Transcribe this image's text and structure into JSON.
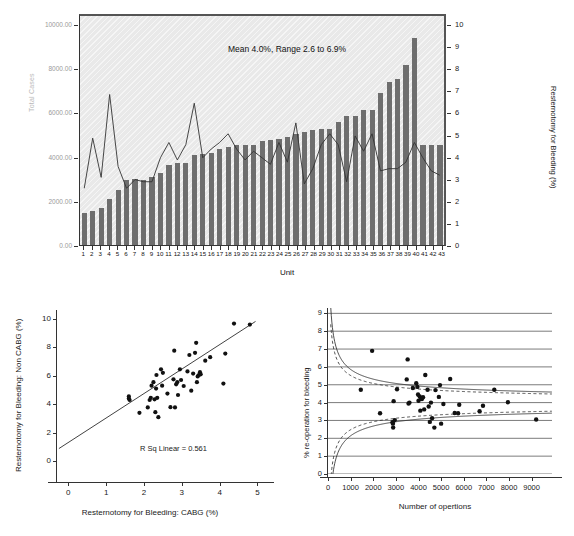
{
  "chart_data": [
    {
      "type": "bar",
      "id": "unit-resternotomy-combo",
      "title": "",
      "annotation": "Mean 4.0%, Range 2.6 to 6.9%",
      "xlabel": "Unit",
      "ylabel": "Total Cases",
      "y2label": "Resternotomy for Bleeding (%)",
      "categories": [
        "1",
        "2",
        "3",
        "4",
        "5",
        "6",
        "7",
        "8",
        "9",
        "10",
        "11",
        "12",
        "13",
        "14",
        "15",
        "16",
        "17",
        "18",
        "19",
        "20",
        "21",
        "22",
        "23",
        "24",
        "25",
        "26",
        "27",
        "28",
        "29",
        "30",
        "31",
        "32",
        "33",
        "34",
        "35",
        "36",
        "37",
        "38",
        "39",
        "40",
        "41",
        "42",
        "43"
      ],
      "ytick_labels": [
        "0.00",
        "2000.00",
        "4000.00",
        "6000.00",
        "8000.00",
        "10000.00"
      ],
      "ytick_values": [
        0,
        2000,
        4000,
        6000,
        8000,
        10000
      ],
      "ylim": [
        0,
        10500
      ],
      "y2tick_labels": [
        "0",
        "1",
        "2",
        "3",
        "4",
        "5",
        "6",
        "7",
        "8",
        "9",
        "10"
      ],
      "y2lim": [
        0,
        10.5
      ],
      "grid": false,
      "bar_color": "#6e6e6e",
      "plot_bg": "#e9e9e9",
      "series": [
        {
          "name": "Total Cases",
          "kind": "bar",
          "values": [
            1450,
            1530,
            1690,
            2090,
            2470,
            2920,
            3000,
            2950,
            3080,
            3240,
            3620,
            3720,
            3700,
            4090,
            4120,
            4180,
            4350,
            4420,
            4530,
            4530,
            4530,
            4730,
            4740,
            4800,
            4880,
            5030,
            5120,
            5190,
            5230,
            5230,
            5590,
            5830,
            5840,
            6090,
            6100,
            6880,
            7400,
            7530,
            8150,
            9350,
            4530,
            4530,
            4530
          ]
        },
        {
          "name": "Resternotomy for Bleeding (%)",
          "kind": "line",
          "values": [
            2.6,
            4.9,
            3.1,
            6.9,
            3.6,
            2.6,
            3.0,
            2.9,
            2.9,
            4.0,
            4.7,
            3.9,
            4.6,
            6.5,
            4.0,
            4.4,
            4.7,
            5.1,
            4.4,
            3.9,
            4.3,
            4.0,
            3.7,
            4.7,
            3.8,
            5.6,
            2.8,
            3.5,
            4.6,
            5.1,
            4.6,
            2.9,
            5.0,
            4.3,
            5.1,
            3.4,
            3.5,
            3.5,
            3.8,
            4.7,
            4.0,
            3.4,
            3.2
          ]
        }
      ]
    },
    {
      "type": "scatter",
      "id": "cabg-vs-noncabg",
      "title": "",
      "xlabel": "Resternotomy for Bleeding: CABG (%)",
      "ylabel": "Resternotomy for Bleeding: Non CABG (%)",
      "annotation": "R Sq Linear = 0.561",
      "xlim": [
        -0.3,
        5.2
      ],
      "ylim": [
        -0.6,
        10.6
      ],
      "xtick_labels": [
        "0",
        "1",
        "2",
        "3",
        "4",
        "5"
      ],
      "ytick_labels": [
        "0",
        "2",
        "4",
        "6",
        "8",
        "10"
      ],
      "fit_line": {
        "x0": -0.25,
        "y0": 0.9,
        "x1": 4.95,
        "y1": 9.8
      },
      "points": [
        [
          1.6,
          4.55
        ],
        [
          1.6,
          4.4
        ],
        [
          1.62,
          4.3
        ],
        [
          1.88,
          3.4
        ],
        [
          2.1,
          3.78
        ],
        [
          2.15,
          4.3
        ],
        [
          2.18,
          4.45
        ],
        [
          2.2,
          5.3
        ],
        [
          2.25,
          5.55
        ],
        [
          2.28,
          4.35
        ],
        [
          2.3,
          3.45
        ],
        [
          2.32,
          5.1
        ],
        [
          2.33,
          6.05
        ],
        [
          2.35,
          4.45
        ],
        [
          2.38,
          3.1
        ],
        [
          2.45,
          6.45
        ],
        [
          2.48,
          5.3
        ],
        [
          2.5,
          6.2
        ],
        [
          2.62,
          4.75
        ],
        [
          2.7,
          3.8
        ],
        [
          2.78,
          5.75
        ],
        [
          2.8,
          7.75
        ],
        [
          2.82,
          3.78
        ],
        [
          2.85,
          5.4
        ],
        [
          2.88,
          5.55
        ],
        [
          2.9,
          4.65
        ],
        [
          2.95,
          6.45
        ],
        [
          2.98,
          5.7
        ],
        [
          3.05,
          5.28
        ],
        [
          3.15,
          6.3
        ],
        [
          3.2,
          7.45
        ],
        [
          3.25,
          4.95
        ],
        [
          3.3,
          6.15
        ],
        [
          3.35,
          7.6
        ],
        [
          3.38,
          8.3
        ],
        [
          3.4,
          5.55
        ],
        [
          3.42,
          5.95
        ],
        [
          3.45,
          6.05
        ],
        [
          3.48,
          6.25
        ],
        [
          3.5,
          6.1
        ],
        [
          3.62,
          7.05
        ],
        [
          3.75,
          7.3
        ],
        [
          4.1,
          5.45
        ],
        [
          4.15,
          7.55
        ],
        [
          4.38,
          9.65
        ],
        [
          4.8,
          9.58
        ]
      ]
    },
    {
      "type": "scatter",
      "id": "funnel-plot",
      "title": "",
      "xlabel": "Number of opertions",
      "ylabel": "% re-operation for bleeding",
      "xlim": [
        0,
        9900
      ],
      "ylim": [
        0,
        9.3
      ],
      "xtick_labels": [
        "0",
        "1000",
        "2000",
        "3000",
        "4000",
        "5000",
        "6000",
        "7000",
        "8000",
        "9000"
      ],
      "xtick_values": [
        0,
        1000,
        2000,
        3000,
        4000,
        5000,
        6000,
        7000,
        8000,
        9000
      ],
      "ytick_labels": [
        "0",
        "1",
        "2",
        "3",
        "4",
        "5",
        "6",
        "7",
        "8",
        "9"
      ],
      "ytick_values": [
        0,
        1,
        2,
        3,
        4,
        5,
        6,
        7,
        8,
        9
      ],
      "grid": true,
      "center_line": 4.0,
      "limits": [
        {
          "name": "3 SD",
          "style": "solid"
        },
        {
          "name": "2 SD",
          "style": "dashed"
        }
      ],
      "points": [
        [
          1450,
          4.72
        ],
        [
          1950,
          6.9
        ],
        [
          2300,
          3.4
        ],
        [
          2850,
          2.9
        ],
        [
          2870,
          2.82
        ],
        [
          2880,
          2.6
        ],
        [
          2900,
          4.08
        ],
        [
          2950,
          3.02
        ],
        [
          3050,
          4.75
        ],
        [
          3480,
          5.3
        ],
        [
          3520,
          6.42
        ],
        [
          3560,
          3.95
        ],
        [
          3600,
          4.0
        ],
        [
          3750,
          4.82
        ],
        [
          3900,
          5.08
        ],
        [
          3950,
          4.88
        ],
        [
          3980,
          4.45
        ],
        [
          4000,
          4.1
        ],
        [
          4050,
          4.35
        ],
        [
          4080,
          3.55
        ],
        [
          4100,
          4.22
        ],
        [
          4150,
          4.2
        ],
        [
          4200,
          4.3
        ],
        [
          4250,
          3.62
        ],
        [
          4300,
          5.55
        ],
        [
          4400,
          4.72
        ],
        [
          4450,
          3.78
        ],
        [
          4500,
          2.92
        ],
        [
          4550,
          4.0
        ],
        [
          4600,
          3.12
        ],
        [
          4700,
          2.6
        ],
        [
          4750,
          4.7
        ],
        [
          4900,
          4.32
        ],
        [
          4950,
          4.98
        ],
        [
          5000,
          2.82
        ],
        [
          5100,
          3.92
        ],
        [
          5400,
          5.32
        ],
        [
          5600,
          3.42
        ],
        [
          5750,
          3.4
        ],
        [
          5800,
          3.88
        ],
        [
          6700,
          3.52
        ],
        [
          6850,
          3.82
        ],
        [
          7350,
          4.72
        ],
        [
          7950,
          4.02
        ],
        [
          9200,
          3.05
        ]
      ]
    }
  ],
  "figure": {
    "panels": [
      {
        "id": "panel-top",
        "name": "unit-bar-line-chart"
      },
      {
        "id": "panel-scatter",
        "name": "cabg-scatter-chart"
      },
      {
        "id": "panel-funnel",
        "name": "funnel-chart"
      }
    ],
    "caption": ""
  }
}
